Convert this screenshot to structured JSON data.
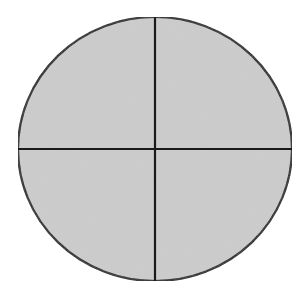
{
  "diagram": {
    "type": "circle-divided-into-quarters",
    "caption": "",
    "shape": {
      "kind": "ellipse",
      "cx": 155,
      "cy": 149,
      "rx": 137,
      "ry": 132,
      "fill": "#cdcdcd",
      "stroke": "#1a1a1a",
      "stroke_width": 2.2
    },
    "dividers": [
      {
        "name": "vertical-divider",
        "x1": 155,
        "y1": 17,
        "x2": 155,
        "y2": 281
      },
      {
        "name": "horizontal-divider",
        "x1": 18,
        "y1": 149,
        "x2": 292,
        "y2": 149
      }
    ],
    "parts": 4,
    "parts_shaded": 4
  }
}
